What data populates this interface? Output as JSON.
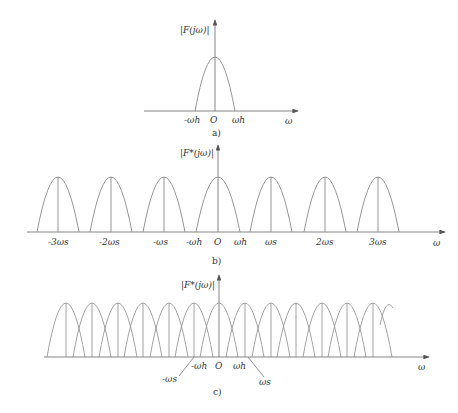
{
  "colors": {
    "line": "#8a8a8a",
    "axis": "#555555",
    "text": "#333333"
  },
  "panels": [
    {
      "id": "a",
      "caption": "a)",
      "y_label": "|F(jω)|",
      "x_label": "ω",
      "tick_labels": [
        "-ωh",
        "O",
        "ωh"
      ],
      "description": "Single baseband spectrum centered at origin, band-limited to ±ωh"
    },
    {
      "id": "b",
      "caption": "b)",
      "y_label": "|F*(jω)|",
      "x_label": "ω",
      "tick_labels": [
        "-3ωs",
        "-2ωs",
        "-ωs",
        "-ωh",
        "O",
        "ωh",
        "ωs",
        "2ωs",
        "3ωs"
      ],
      "description": "Sampled spectrum with replicas at multiples of ωs, non-overlapping"
    },
    {
      "id": "c",
      "caption": "c)",
      "y_label": "|F*(jω)|",
      "x_label": "ω",
      "tick_labels": [
        "-ωs",
        "-ωh",
        "O",
        "ωh",
        "ωs"
      ],
      "description": "Sampled spectrum with overlapping replicas (aliasing), ωs < 2ωh"
    }
  ]
}
